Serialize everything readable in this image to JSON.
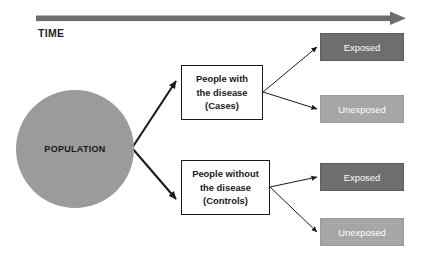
{
  "diagram": {
    "timeline": {
      "label": "TIME",
      "arrow_name": "time-arrow",
      "color": "#6e6e6e",
      "direction": "left-to-right"
    },
    "source": {
      "label": "POPULATION",
      "shape": "circle",
      "color": "#9b9b9b",
      "text_color": "#1a1a1a"
    },
    "groups": [
      {
        "id": "cases",
        "lines": [
          "People with",
          "the disease",
          "(Cases)"
        ],
        "fill": "#ffffff",
        "border": "#1a1a1a"
      },
      {
        "id": "controls",
        "lines": [
          "People without",
          "the disease",
          "(Controls)"
        ],
        "fill": "#ffffff",
        "border": "#1a1a1a"
      }
    ],
    "outcomes": [
      {
        "id": "case-exposed",
        "label": "Exposed",
        "fill": "#6e6e6e",
        "text_color": "#ffffff"
      },
      {
        "id": "case-unexposed",
        "label": "Unexposed",
        "fill": "#a6a6a6",
        "text_color": "#ffffff"
      },
      {
        "id": "ctrl-exposed",
        "label": "Exposed",
        "fill": "#6e6e6e",
        "text_color": "#ffffff"
      },
      {
        "id": "ctrl-unexposed",
        "label": "Unexposed",
        "fill": "#a6a6a6",
        "text_color": "#ffffff"
      }
    ],
    "edges": [
      {
        "from": "POPULATION",
        "to": "Cases",
        "weight": "thick"
      },
      {
        "from": "POPULATION",
        "to": "Controls",
        "weight": "thick"
      },
      {
        "from": "Cases",
        "to": "Exposed",
        "weight": "thin"
      },
      {
        "from": "Cases",
        "to": "Unexposed",
        "weight": "thin"
      },
      {
        "from": "Controls",
        "to": "Exposed",
        "weight": "thin"
      },
      {
        "from": "Controls",
        "to": "Unexposed",
        "weight": "thin"
      }
    ]
  }
}
